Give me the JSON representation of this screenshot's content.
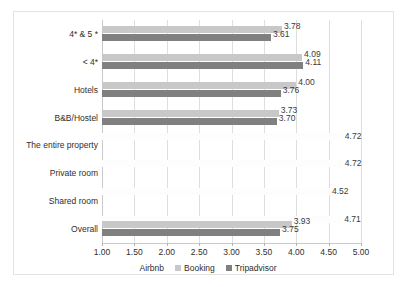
{
  "chart_data": {
    "type": "bar",
    "orientation": "horizontal",
    "title": "",
    "xlabel": "",
    "ylabel": "",
    "xlim": [
      1.0,
      5.0
    ],
    "xticks": [
      "1.00",
      "1.50",
      "2.00",
      "2.50",
      "3.00",
      "3.50",
      "4.00",
      "4.50",
      "5.00"
    ],
    "xtick_values": [
      1.0,
      1.5,
      2.0,
      2.5,
      3.0,
      3.5,
      4.0,
      4.5,
      5.0
    ],
    "grid": true,
    "legend_position": "bottom",
    "categories": [
      "4* & 5 *",
      "< 4*",
      "Hotels",
      "B&B/Hostel",
      "The entire property",
      "Private room",
      "Shared room",
      "Overall"
    ],
    "series": [
      {
        "name": "Airbnb",
        "color": "#fdfdfd",
        "values": [
          null,
          null,
          null,
          null,
          4.72,
          4.72,
          4.52,
          4.71
        ],
        "labels": [
          "",
          "",
          "",
          "",
          "4.72",
          "4.72",
          "4.52",
          "4.71"
        ]
      },
      {
        "name": "Booking",
        "color": "#c8c8c8",
        "values": [
          3.78,
          4.09,
          4.0,
          3.73,
          null,
          null,
          null,
          3.93
        ],
        "labels": [
          "3.78",
          "4.09",
          "4.00",
          "3.73",
          "",
          "",
          "",
          "3.93"
        ]
      },
      {
        "name": "Tripadvisor",
        "color": "#808080",
        "values": [
          3.61,
          4.11,
          3.76,
          3.7,
          null,
          null,
          null,
          3.75
        ],
        "labels": [
          "3.61",
          "4.11",
          "3.76",
          "3.70",
          "",
          "",
          "",
          "3.75"
        ]
      }
    ]
  },
  "legend": {
    "items": [
      {
        "label": "Airbnb",
        "color": "#fdfdfd"
      },
      {
        "label": "Booking",
        "color": "#c8c8c8"
      },
      {
        "label": "Tripadvisor",
        "color": "#808080"
      }
    ]
  }
}
